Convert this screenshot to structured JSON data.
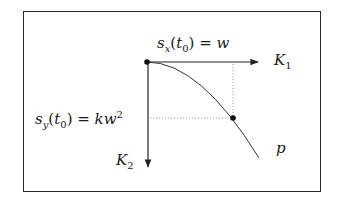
{
  "diagram": {
    "type": "coordinate-sketch",
    "labels": {
      "sx": {
        "fn": "s",
        "sub": "x",
        "arg_var": "t",
        "arg_sub": "0",
        "rhs": "w",
        "full": "s_x(t_0) = w"
      },
      "sy": {
        "fn": "s",
        "sub": "y",
        "arg_var": "t",
        "arg_sub": "0",
        "rhs": "kw",
        "rhs_sup": "2",
        "full": "s_y(t_0) = kw^2"
      },
      "k1": {
        "var": "K",
        "sub": "1"
      },
      "k2": {
        "var": "K",
        "sub": "2"
      },
      "p": "p"
    },
    "symbols": {
      "lparen": "(",
      "rparen": ")",
      "equals": " = "
    },
    "elements": {
      "origin_point": {
        "x": 147,
        "y": 62
      },
      "k1_axis": {
        "from": [
          147,
          62
        ],
        "to": [
          258,
          62
        ],
        "direction": "right"
      },
      "k2_axis": {
        "from": [
          148,
          62
        ],
        "to": [
          148,
          167
        ],
        "direction": "down"
      },
      "curve_p": {
        "shape": "parabola",
        "from": [
          147,
          62
        ],
        "through": [
          233,
          118
        ],
        "to": [
          259,
          158
        ]
      },
      "marked_point": {
        "x": 233,
        "y": 118
      },
      "dotted_vertical": {
        "from": [
          233,
          62
        ],
        "to": [
          233,
          118
        ]
      },
      "dotted_horizontal": {
        "from": [
          148,
          118
        ],
        "to": [
          233,
          118
        ]
      }
    },
    "colors": {
      "line": "#222222",
      "dotted": "#888888",
      "background": "#ffffff"
    }
  }
}
